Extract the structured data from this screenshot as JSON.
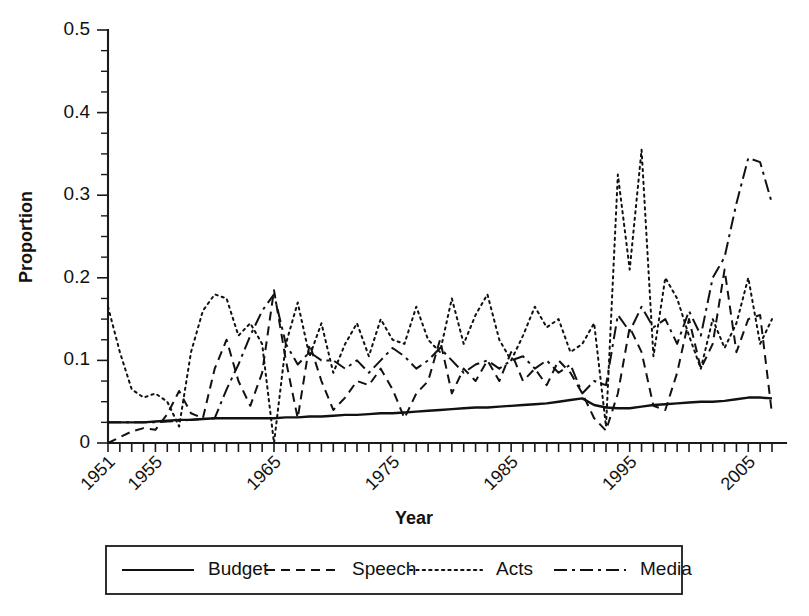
{
  "chart_data": {
    "type": "line",
    "title": "",
    "xlabel": "Year",
    "ylabel": "Proportion",
    "xlim": [
      1951,
      2007
    ],
    "ylim": [
      0,
      0.5
    ],
    "yticks": [
      0,
      0.1,
      0.2,
      0.3,
      0.4,
      0.5
    ],
    "ytick_labels": [
      "0",
      "0.1",
      "0.2",
      "0.3",
      "0.4",
      "0.5"
    ],
    "xticks": [
      1951,
      1955,
      1965,
      1975,
      1985,
      1995,
      2005
    ],
    "xtick_labels": [
      "1951",
      "1955",
      "1965",
      "1975",
      "1985",
      "1995",
      "2005"
    ],
    "xtick_rotation_deg": 45,
    "minor_ticks": {
      "x_every_years": 1,
      "y_every": 0.025
    },
    "grid": false,
    "legend_position": "below-axes",
    "x": [
      1951,
      1952,
      1953,
      1954,
      1955,
      1956,
      1957,
      1958,
      1959,
      1960,
      1961,
      1962,
      1963,
      1964,
      1965,
      1966,
      1967,
      1968,
      1969,
      1970,
      1971,
      1972,
      1973,
      1974,
      1975,
      1976,
      1977,
      1978,
      1979,
      1980,
      1981,
      1982,
      1983,
      1984,
      1985,
      1986,
      1987,
      1988,
      1989,
      1990,
      1991,
      1992,
      1993,
      1994,
      1995,
      1996,
      1997,
      1998,
      1999,
      2000,
      2001,
      2002,
      2003,
      2004,
      2005,
      2006,
      2007
    ],
    "series": [
      {
        "name": "Budget",
        "style": "solid",
        "values": [
          0.025,
          0.025,
          0.025,
          0.025,
          0.026,
          0.027,
          0.028,
          0.028,
          0.029,
          0.03,
          0.03,
          0.03,
          0.03,
          0.03,
          0.03,
          0.031,
          0.031,
          0.032,
          0.032,
          0.033,
          0.034,
          0.034,
          0.035,
          0.036,
          0.036,
          0.037,
          0.038,
          0.039,
          0.04,
          0.041,
          0.042,
          0.043,
          0.043,
          0.044,
          0.045,
          0.046,
          0.047,
          0.048,
          0.05,
          0.052,
          0.054,
          0.046,
          0.043,
          0.042,
          0.042,
          0.044,
          0.046,
          0.047,
          0.048,
          0.049,
          0.05,
          0.05,
          0.051,
          0.053,
          0.055,
          0.055,
          0.054
        ]
      },
      {
        "name": "Speech",
        "style": "dashed",
        "values": [
          0.0,
          0.007,
          0.014,
          0.018,
          0.016,
          0.035,
          0.063,
          0.036,
          0.03,
          0.09,
          0.125,
          0.075,
          0.045,
          0.085,
          0.185,
          0.1,
          0.03,
          0.12,
          0.075,
          0.04,
          0.055,
          0.075,
          0.07,
          0.09,
          0.065,
          0.03,
          0.06,
          0.075,
          0.125,
          0.06,
          0.09,
          0.075,
          0.1,
          0.075,
          0.11,
          0.075,
          0.09,
          0.07,
          0.1,
          0.085,
          0.06,
          0.03,
          0.015,
          0.06,
          0.14,
          0.11,
          0.045,
          0.04,
          0.085,
          0.15,
          0.09,
          0.12,
          0.21,
          0.11,
          0.15,
          0.155,
          0.035
        ]
      },
      {
        "name": "Acts",
        "style": "dotted",
        "values": [
          0.165,
          0.11,
          0.065,
          0.055,
          0.06,
          0.05,
          0.02,
          0.11,
          0.16,
          0.18,
          0.175,
          0.13,
          0.145,
          0.12,
          0.0,
          0.12,
          0.17,
          0.105,
          0.145,
          0.085,
          0.12,
          0.145,
          0.105,
          0.15,
          0.125,
          0.12,
          0.165,
          0.125,
          0.11,
          0.175,
          0.12,
          0.155,
          0.18,
          0.125,
          0.1,
          0.13,
          0.165,
          0.14,
          0.15,
          0.11,
          0.12,
          0.145,
          0.02,
          0.325,
          0.21,
          0.355,
          0.105,
          0.2,
          0.175,
          0.13,
          0.09,
          0.15,
          0.115,
          0.145,
          0.2,
          0.12,
          0.15
        ]
      },
      {
        "name": "Media",
        "style": "dash-dot",
        "values": [
          0.025,
          0.025,
          0.025,
          0.025,
          0.025,
          0.026,
          0.027,
          0.028,
          0.029,
          0.03,
          0.065,
          0.095,
          0.13,
          0.16,
          0.18,
          0.12,
          0.095,
          0.11,
          0.1,
          0.1,
          0.09,
          0.1,
          0.085,
          0.1,
          0.115,
          0.105,
          0.09,
          0.1,
          0.115,
          0.1,
          0.085,
          0.095,
          0.1,
          0.09,
          0.1,
          0.105,
          0.09,
          0.1,
          0.085,
          0.095,
          0.06,
          0.075,
          0.07,
          0.155,
          0.135,
          0.165,
          0.14,
          0.15,
          0.12,
          0.16,
          0.13,
          0.2,
          0.225,
          0.29,
          0.345,
          0.34,
          0.29
        ]
      }
    ],
    "legend": [
      {
        "label": "Budget",
        "style": "solid"
      },
      {
        "label": "Speech",
        "style": "dashed"
      },
      {
        "label": "Acts",
        "style": "dotted"
      },
      {
        "label": "Media",
        "style": "dash-dot"
      }
    ]
  }
}
